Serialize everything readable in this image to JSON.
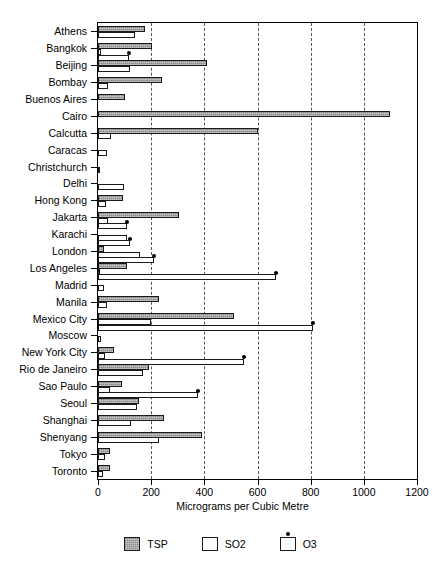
{
  "chart_data": {
    "type": "bar",
    "orientation": "horizontal",
    "title": "",
    "xlabel": "Micrograms per Cubic Metre",
    "ylabel": "",
    "xlim": [
      0,
      1200
    ],
    "xticks": [
      0,
      200,
      400,
      600,
      800,
      1000,
      1200
    ],
    "xtick_labels": [
      "0",
      "200",
      "400",
      "600",
      "800",
      "1000",
      "1200"
    ],
    "grid": "vertical-dashed",
    "legend_position": "bottom",
    "categories": [
      "Athens",
      "Bangkok",
      "Beijing",
      "Bombay",
      "Buenos Aires",
      "Cairo",
      "Calcutta",
      "Caracas",
      "Christchurch",
      "Delhi",
      "Hong Kong",
      "Jakarta",
      "Karachi",
      "London",
      "Los Angeles",
      "Madrid",
      "Manila",
      "Mexico City",
      "Moscow",
      "New York City",
      "Rio de Janeiro",
      "Sao Paulo",
      "Seoul",
      "Shanghai",
      "Shenyang",
      "Tokyo",
      "Toronto"
    ],
    "series": [
      {
        "name": "TSP",
        "style": "gray-filled-bar",
        "values": [
          178,
          205,
          410,
          240,
          100,
          1100,
          600,
          null,
          null,
          null,
          95,
          305,
          null,
          22,
          110,
          null,
          230,
          510,
          null,
          60,
          190,
          90,
          155,
          250,
          390,
          45,
          45
        ]
      },
      {
        "name": "SO2",
        "style": "white-bar",
        "values": [
          138,
          11,
          120,
          38,
          null,
          null,
          49,
          33,
          3,
          97,
          30,
          38,
          108,
          158,
          9,
          24,
          33,
          200,
          10,
          28,
          170,
          45,
          145,
          125,
          230,
          27,
          17
        ]
      },
      {
        "name": "O3",
        "style": "white-bar-with-dot",
        "values": [
          null,
          117,
          null,
          null,
          null,
          null,
          null,
          null,
          null,
          null,
          null,
          108,
          122,
          212,
          670,
          null,
          null,
          810,
          null,
          550,
          null,
          375,
          null,
          null,
          null,
          null,
          null
        ]
      }
    ]
  },
  "legend": {
    "items": [
      {
        "label": "TSP",
        "style": "tsp"
      },
      {
        "label": "SO2",
        "style": "so2"
      },
      {
        "label": "O3",
        "style": "o3"
      }
    ]
  }
}
